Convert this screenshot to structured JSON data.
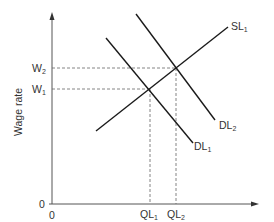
{
  "diagram": {
    "type": "labor-market-supply-demand",
    "y_axis_label": "Wage rate",
    "x_axis_label": "Quantity of workers employed",
    "y_origin_label": "0",
    "x_origin_label": "0",
    "wage_levels": [
      {
        "id": "W1",
        "base": "W",
        "sub": "1"
      },
      {
        "id": "W2",
        "base": "W",
        "sub": "2"
      }
    ],
    "quantity_levels": [
      {
        "id": "QL1",
        "base": "QL",
        "sub": "1"
      },
      {
        "id": "QL2",
        "base": "QL",
        "sub": "2"
      }
    ],
    "curves": [
      {
        "id": "SL1",
        "base": "SL",
        "sub": "1",
        "kind": "supply"
      },
      {
        "id": "DL1",
        "base": "DL",
        "sub": "1",
        "kind": "demand"
      },
      {
        "id": "DL2",
        "base": "DL",
        "sub": "2",
        "kind": "demand"
      }
    ],
    "equilibria": [
      {
        "wage": "W1",
        "quantity": "QL1",
        "demand": "DL1",
        "supply": "SL1"
      },
      {
        "wage": "W2",
        "quantity": "QL2",
        "demand": "DL2",
        "supply": "SL1"
      }
    ],
    "colors": {
      "line": "#1a1a1a",
      "dashed": "#555555",
      "text": "#333333"
    }
  }
}
